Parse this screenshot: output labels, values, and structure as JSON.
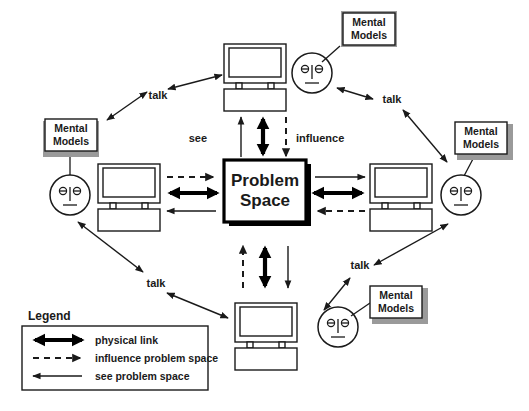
{
  "diagram": {
    "title_center": "Problem Space",
    "center_label_line1": "Problem",
    "center_label_line2": "Space",
    "flow_labels": {
      "see": "see",
      "influence": "influence"
    },
    "talk_labels": [
      "talk",
      "talk",
      "talk",
      "talk"
    ],
    "mental_models": [
      {
        "line1": "Mental",
        "line2": "Models"
      },
      {
        "line1": "Mental",
        "line2": "Models"
      },
      {
        "line1": "Mental",
        "line2": "Models"
      },
      {
        "line1": "Mental",
        "line2": "Models"
      }
    ],
    "legend": {
      "title": "Legend",
      "items": [
        {
          "style": "thick-double-arrow",
          "label": "physical link"
        },
        {
          "style": "dashed-arrow-right",
          "label": "influence problem space"
        },
        {
          "style": "thin-arrow-left",
          "label": "see problem space"
        }
      ]
    },
    "colors": {
      "ink": "#1a1a1a",
      "black": "#000000",
      "paper": "#ffffff",
      "box_shadow": "#9a9a9a"
    },
    "icons": {
      "computer": "computer-icon",
      "face": "face-icon",
      "mental_models_box": "mental-models-box"
    }
  }
}
